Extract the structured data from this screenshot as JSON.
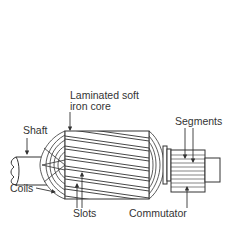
{
  "diagram": {
    "labels": {
      "core_line1": "Laminated soft",
      "core_line2": "iron core",
      "shaft": "Shaft",
      "segments": "Segments",
      "coils": "Coils",
      "slots": "Slots",
      "commutator": "Commutator"
    },
    "colors": {
      "stroke": "#333333",
      "background": "#ffffff"
    }
  }
}
